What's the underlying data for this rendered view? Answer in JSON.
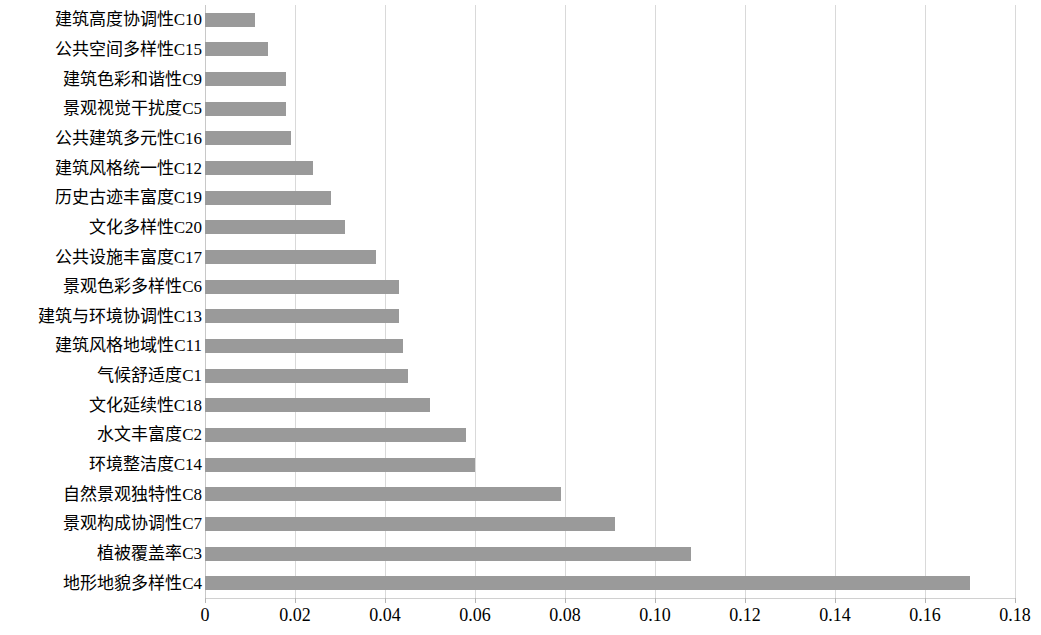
{
  "chart_data": {
    "type": "bar",
    "orientation": "horizontal",
    "title": "",
    "subtitle": "",
    "xlabel": "",
    "ylabel": "",
    "xlim": [
      0,
      0.18
    ],
    "xticks": [
      "0",
      "0.02",
      "0.04",
      "0.06",
      "0.08",
      "0.10",
      "0.12",
      "0.14",
      "0.16",
      "0.18"
    ],
    "xtick_values": [
      0,
      0.02,
      0.04,
      0.06,
      0.08,
      0.1,
      0.12,
      0.14,
      0.16,
      0.18
    ],
    "grid": true,
    "grid_axis": "x",
    "legend": false,
    "legend_position": "none",
    "bar_color": "#9a9a9a",
    "grid_color": "#d9d9d9",
    "background_color": "#ffffff",
    "categories": [
      "建筑高度协调性C10",
      "公共空间多样性C15",
      "建筑色彩和谐性C9",
      "景观视觉干扰度C5",
      "公共建筑多元性C16",
      "建筑风格统一性C12",
      "历史古迹丰富度C19",
      "文化多样性C20",
      "公共设施丰富度C17",
      "景观色彩多样性C6",
      "建筑与环境协调性C13",
      "建筑风格地域性C11",
      "气候舒适度C1",
      "文化延续性C18",
      "水文丰富度C2",
      "环境整洁度C14",
      "自然景观独特性C8",
      "景观构成协调性C7",
      "植被覆盖率C3",
      "地形地貌多样性C4"
    ],
    "values": [
      0.011,
      0.014,
      0.018,
      0.018,
      0.019,
      0.024,
      0.028,
      0.031,
      0.038,
      0.043,
      0.043,
      0.044,
      0.045,
      0.05,
      0.058,
      0.06,
      0.079,
      0.091,
      0.108,
      0.17
    ]
  }
}
